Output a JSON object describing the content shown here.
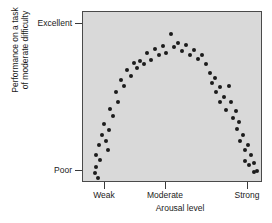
{
  "chart_data": {
    "type": "scatter",
    "title": "",
    "xlabel": "Arousal level",
    "ylabel": "Performance on a task of moderate difficulty",
    "ylabel_line1": "Performance on a task",
    "ylabel_line2": "of moderate difficulty",
    "xticklabels": [
      "Weak",
      "Moderate",
      "Strong"
    ],
    "xtick_positions": [
      0.122,
      0.461,
      0.917
    ],
    "yticklabels": [
      "Excellent",
      "Poor"
    ],
    "ytick_positions": [
      0.93,
      0.07
    ],
    "xlim": [
      0,
      1
    ],
    "ylim": [
      0,
      1
    ],
    "grid": false,
    "legend": null,
    "annotation": "Inverted-U relationship between arousal level and performance",
    "marker": "filled-circle",
    "marker_color": "#1c1c1c",
    "plot_background": "#d9d9d9",
    "figure_background": "#ffffff",
    "frame_color": "#4a4a4a",
    "points": [
      [
        0.065,
        0.045
      ],
      [
        0.072,
        0.085
      ],
      [
        0.085,
        0.015
      ],
      [
        0.075,
        0.155
      ],
      [
        0.098,
        0.125
      ],
      [
        0.092,
        0.215
      ],
      [
        0.108,
        0.275
      ],
      [
        0.128,
        0.235
      ],
      [
        0.118,
        0.34
      ],
      [
        0.138,
        0.185
      ],
      [
        0.148,
        0.3
      ],
      [
        0.152,
        0.425
      ],
      [
        0.17,
        0.385
      ],
      [
        0.185,
        0.525
      ],
      [
        0.198,
        0.47
      ],
      [
        0.212,
        0.6
      ],
      [
        0.232,
        0.56
      ],
      [
        0.248,
        0.655
      ],
      [
        0.268,
        0.62
      ],
      [
        0.285,
        0.7
      ],
      [
        0.305,
        0.67
      ],
      [
        0.322,
        0.71
      ],
      [
        0.345,
        0.69
      ],
      [
        0.362,
        0.76
      ],
      [
        0.382,
        0.715
      ],
      [
        0.405,
        0.78
      ],
      [
        0.425,
        0.745
      ],
      [
        0.448,
        0.8
      ],
      [
        0.468,
        0.76
      ],
      [
        0.492,
        0.87
      ],
      [
        0.512,
        0.79
      ],
      [
        0.535,
        0.815
      ],
      [
        0.558,
        0.77
      ],
      [
        0.578,
        0.805
      ],
      [
        0.6,
        0.745
      ],
      [
        0.622,
        0.775
      ],
      [
        0.645,
        0.72
      ],
      [
        0.668,
        0.745
      ],
      [
        0.69,
        0.69
      ],
      [
        0.712,
        0.64
      ],
      [
        0.722,
        0.58
      ],
      [
        0.742,
        0.61
      ],
      [
        0.748,
        0.525
      ],
      [
        0.768,
        0.555
      ],
      [
        0.772,
        0.47
      ],
      [
        0.792,
        0.5
      ],
      [
        0.805,
        0.42
      ],
      [
        0.818,
        0.56
      ],
      [
        0.832,
        0.47
      ],
      [
        0.845,
        0.37
      ],
      [
        0.858,
        0.415
      ],
      [
        0.865,
        0.31
      ],
      [
        0.878,
        0.35
      ],
      [
        0.882,
        0.235
      ],
      [
        0.898,
        0.275
      ],
      [
        0.908,
        0.185
      ],
      [
        0.912,
        0.12
      ],
      [
        0.928,
        0.215
      ],
      [
        0.932,
        0.095
      ],
      [
        0.945,
        0.155
      ],
      [
        0.958,
        0.055
      ],
      [
        0.962,
        0.105
      ],
      [
        0.978,
        0.06
      ]
    ]
  }
}
